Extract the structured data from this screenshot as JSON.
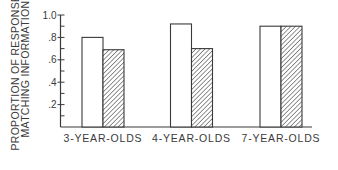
{
  "chart_data": {
    "type": "bar",
    "title": "",
    "xlabel": "",
    "ylabel": [
      "PROPORTION OF RESPONSES",
      "MATCHING INFORMATION"
    ],
    "categories": [
      "3-YEAR-OLDS",
      "4-YEAR-OLDS",
      "7-YEAR-OLDS"
    ],
    "series": [
      {
        "name": "open bars",
        "pattern": "white",
        "values": [
          0.8,
          0.92,
          0.9
        ]
      },
      {
        "name": "hatched bars",
        "pattern": "diagonal-hatch",
        "values": [
          0.69,
          0.7,
          0.9
        ]
      }
    ],
    "ylim": [
      0,
      1.0
    ],
    "yticks": [
      0.2,
      0.4,
      0.6,
      0.8,
      1.0
    ],
    "ytick_labels": [
      ".2",
      ".4",
      ".6",
      ".8",
      "1.0"
    ],
    "minor_tick_step": 0.1,
    "legend": "none",
    "grid": false
  },
  "colors": {
    "ink": "#3a3a3a",
    "background": "#ffffff",
    "bar_fill": "#ffffff"
  }
}
